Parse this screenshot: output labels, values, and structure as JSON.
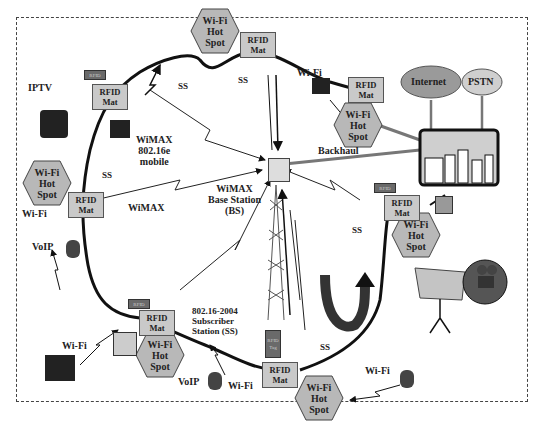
{
  "diagram": {
    "colors": {
      "hotspot_fill": "#b8b8b8",
      "mat_fill": "#c9c9c9",
      "tag_fill": "#6a6a6a",
      "ring": "#111111",
      "backhaul": "#777777",
      "cloud": "#9a9a9a",
      "city_sky": "#cfcfcf",
      "frame": "#444444"
    },
    "labels": {
      "iptv": "IPTV",
      "wimax_mobile": [
        "WiMAX",
        "802.16e",
        "mobile"
      ],
      "wimax": "WiMAX",
      "bs": [
        "WiMAX",
        "Base Station",
        "(BS)"
      ],
      "backhaul": "Backhaul",
      "internet": "Internet",
      "pstn": "PSTN",
      "subscriber": [
        "802.16-2004",
        "Subscriber",
        "Station (SS)"
      ],
      "ss": "SS",
      "wifi": "Wi-Fi",
      "voip": "VoIP"
    },
    "hotspot": [
      "Wi-Fi",
      "Hot",
      "Spot"
    ],
    "rfid_mat": [
      "RFID",
      "Mat"
    ],
    "rfid_tag": "RFID",
    "rfid_tag_v": [
      "RFID",
      "Tag"
    ]
  }
}
